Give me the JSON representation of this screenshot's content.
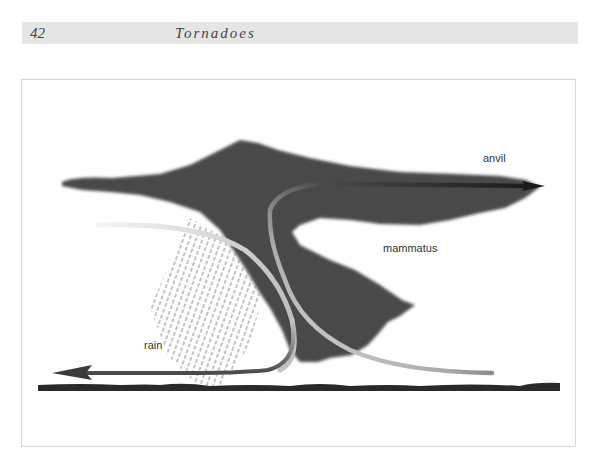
{
  "header": {
    "page_number": "42",
    "running_title": "Tornadoes"
  },
  "figure": {
    "labels": {
      "anvil": "anvil",
      "mammatus": "mammatus",
      "rain": "rain"
    },
    "colors": {
      "cloud": "#4a4a4a",
      "ground": "#2a2a2a",
      "updraft_dark": "#1f1f1f",
      "inflow_light": "#e0e0e0",
      "downdraft": "#5a5a5a",
      "rain_streaks": "#777777",
      "frame_border": "#d6d6d6",
      "header_bg": "#e6e6e6"
    }
  }
}
